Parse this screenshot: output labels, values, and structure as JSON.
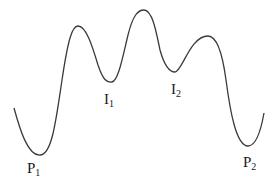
{
  "diagram": {
    "type": "energy-landscape-curve",
    "curve_color": "#3a3a3a",
    "labels": [
      {
        "id": "P1",
        "base": "P",
        "sub": "1",
        "x": 27,
        "y": 161
      },
      {
        "id": "I1",
        "base": "I",
        "sub": "1",
        "x": 104,
        "y": 92
      },
      {
        "id": "I2",
        "base": "I",
        "sub": "2",
        "x": 171,
        "y": 82
      },
      {
        "id": "P2",
        "base": "P",
        "sub": "2",
        "x": 243,
        "y": 155
      }
    ]
  }
}
